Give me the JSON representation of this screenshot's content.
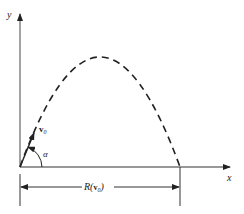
{
  "diagram": {
    "axes": {
      "x_label": "x",
      "y_label": "y"
    },
    "vector": {
      "label": "v",
      "subscript": "0"
    },
    "angle": {
      "label": "α"
    },
    "range": {
      "label_prefix": "R(",
      "label_vec": "v",
      "label_sub": "0",
      "label_suffix": ")"
    },
    "colors": {
      "line": "#222222",
      "axis": "#555555",
      "background": "#ffffff"
    }
  }
}
